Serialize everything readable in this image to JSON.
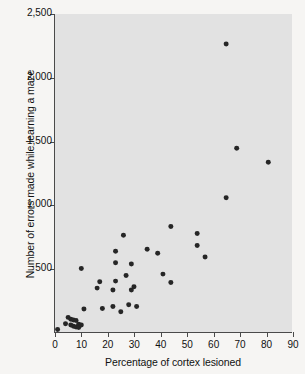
{
  "chart_data": {
    "type": "scatter",
    "title": "",
    "xlabel": "Percentage of cortex lesioned",
    "ylabel": "Number of errors made while learning a maze",
    "xlim": [
      0,
      90
    ],
    "ylim": [
      0,
      2500
    ],
    "grid": false,
    "legend": null,
    "xticks": [
      0,
      10,
      20,
      30,
      40,
      50,
      60,
      70,
      80,
      90
    ],
    "xtick_labels": [
      "0",
      "10",
      "20",
      "30",
      "40",
      "50",
      "60",
      "70",
      "80",
      "90"
    ],
    "yticks": [
      500,
      1000,
      1500,
      2000,
      2500
    ],
    "ytick_labels": [
      "500",
      "1,000",
      "1,500",
      "2,000",
      "2,500"
    ],
    "marker": "filled-circle",
    "marker_color": "#262626",
    "panel_color": "#e2e2e2",
    "page_color": "#f6f5f3",
    "axis_color": "#4a4a4a",
    "points": [
      {
        "x": 1,
        "y": 20
      },
      {
        "x": 4,
        "y": 65
      },
      {
        "x": 5,
        "y": 115
      },
      {
        "x": 6,
        "y": 100
      },
      {
        "x": 6,
        "y": 55
      },
      {
        "x": 7,
        "y": 45
      },
      {
        "x": 7,
        "y": 95
      },
      {
        "x": 8,
        "y": 90
      },
      {
        "x": 8,
        "y": 40
      },
      {
        "x": 9,
        "y": 60
      },
      {
        "x": 9,
        "y": 35
      },
      {
        "x": 10,
        "y": 55
      },
      {
        "x": 10,
        "y": 500
      },
      {
        "x": 11,
        "y": 180
      },
      {
        "x": 16,
        "y": 345
      },
      {
        "x": 17,
        "y": 395
      },
      {
        "x": 18,
        "y": 185
      },
      {
        "x": 22,
        "y": 330
      },
      {
        "x": 22,
        "y": 200
      },
      {
        "x": 23,
        "y": 635
      },
      {
        "x": 23,
        "y": 545
      },
      {
        "x": 23,
        "y": 400
      },
      {
        "x": 25,
        "y": 160
      },
      {
        "x": 26,
        "y": 760
      },
      {
        "x": 27,
        "y": 445
      },
      {
        "x": 28,
        "y": 215
      },
      {
        "x": 29,
        "y": 330
      },
      {
        "x": 29,
        "y": 535
      },
      {
        "x": 30,
        "y": 355
      },
      {
        "x": 31,
        "y": 200
      },
      {
        "x": 35,
        "y": 650
      },
      {
        "x": 39,
        "y": 620
      },
      {
        "x": 41,
        "y": 455
      },
      {
        "x": 44,
        "y": 830
      },
      {
        "x": 44,
        "y": 390
      },
      {
        "x": 54,
        "y": 775
      },
      {
        "x": 54,
        "y": 680
      },
      {
        "x": 57,
        "y": 590
      },
      {
        "x": 65,
        "y": 2265
      },
      {
        "x": 65,
        "y": 1055
      },
      {
        "x": 69,
        "y": 1445
      },
      {
        "x": 81,
        "y": 1335
      }
    ]
  }
}
